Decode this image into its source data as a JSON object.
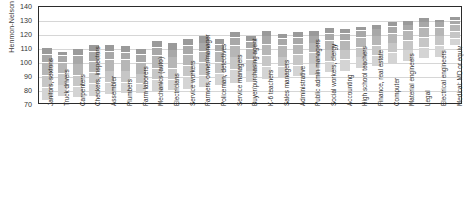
{
  "chart_data": {
    "type": "bar",
    "title": "",
    "subtitle": "",
    "xlabel": "",
    "ylabel": "Henmon-Nelson IQ",
    "ylim": [
      70,
      140
    ],
    "ytick_labels": [
      "70",
      "80",
      "90",
      "100",
      "110",
      "120",
      "130",
      "140"
    ],
    "ytick_values": [
      70,
      80,
      90,
      100,
      110,
      120,
      130,
      140
    ],
    "grid": true,
    "legend": "none",
    "orientation": "vertical",
    "bar_style": "floating-range-bar-with-percentile-bands",
    "band_colors": [
      "#8c8c8c",
      "#9a9a9a",
      "#a8a8a8",
      "#b6b6b6",
      "#c6c6c6",
      "#d4d4d4"
    ],
    "frame_color": "#2b2b2b",
    "gridline_color": "#d6d6d6",
    "background_color": "#ffffff",
    "categories": [
      "Janitors, sextons",
      "Truck drivers",
      "Carpenters",
      "Checkers, inspectors",
      "Assembler",
      "Plumbers",
      "Farm laborers",
      "Mechanics (auto)",
      "Electricians",
      "Service workers",
      "Farmers, owner/manager",
      "Policeman, detectives",
      "Service managers",
      "Buyer/purchasing agent",
      "K-6 teachers",
      "Sales managers",
      "Administrative",
      "Public admin managers",
      "Social workers, clergy",
      "Accounting",
      "High school teachers",
      "Finance, real estate",
      "Computer",
      "Material engineers",
      "Legal",
      "Electrical engineers",
      "Medical: MD or equiv"
    ],
    "series": [
      {
        "name": "IQ range (low to high percentile)",
        "low": [
          73,
          76,
          75,
          76,
          77,
          78,
          78,
          79,
          80,
          81,
          82,
          84,
          85,
          86,
          88,
          89,
          90,
          91,
          93,
          94,
          96,
          97,
          99,
          101,
          103,
          104,
          112
        ],
        "high": [
          111,
          108,
          110,
          113,
          113,
          112,
          110,
          116,
          114,
          117,
          119,
          117,
          122,
          119,
          123,
          121,
          122,
          123,
          125,
          124,
          126,
          127,
          129,
          130,
          132,
          131,
          133
        ],
        "bands": [
          [
            73,
            82,
            91,
            100,
            106,
            111
          ],
          [
            76,
            84,
            92,
            100,
            105,
            108
          ],
          [
            75,
            83,
            91,
            99,
            105,
            110
          ],
          [
            76,
            85,
            93,
            101,
            108,
            113
          ],
          [
            77,
            86,
            94,
            102,
            108,
            113
          ],
          [
            78,
            86,
            94,
            102,
            107,
            112
          ],
          [
            78,
            85,
            92,
            100,
            106,
            110
          ],
          [
            79,
            88,
            96,
            105,
            111,
            116
          ],
          [
            80,
            88,
            96,
            104,
            109,
            114
          ],
          [
            81,
            90,
            98,
            106,
            112,
            117
          ],
          [
            82,
            91,
            100,
            108,
            114,
            119
          ],
          [
            84,
            92,
            100,
            108,
            113,
            117
          ],
          [
            85,
            95,
            104,
            112,
            118,
            122
          ],
          [
            86,
            94,
            102,
            110,
            115,
            119
          ],
          [
            88,
            97,
            105,
            113,
            119,
            123
          ],
          [
            89,
            97,
            104,
            112,
            117,
            121
          ],
          [
            90,
            98,
            106,
            113,
            118,
            122
          ],
          [
            91,
            99,
            107,
            114,
            119,
            123
          ],
          [
            93,
            101,
            109,
            116,
            121,
            125
          ],
          [
            94,
            102,
            109,
            116,
            121,
            124
          ],
          [
            96,
            104,
            111,
            118,
            123,
            126
          ],
          [
            97,
            105,
            112,
            119,
            124,
            127
          ],
          [
            99,
            107,
            114,
            121,
            126,
            129
          ],
          [
            101,
            109,
            116,
            123,
            127,
            130
          ],
          [
            103,
            111,
            118,
            125,
            129,
            132
          ],
          [
            104,
            112,
            119,
            125,
            129,
            131
          ],
          [
            112,
            117,
            122,
            127,
            130,
            133
          ]
        ]
      }
    ]
  }
}
